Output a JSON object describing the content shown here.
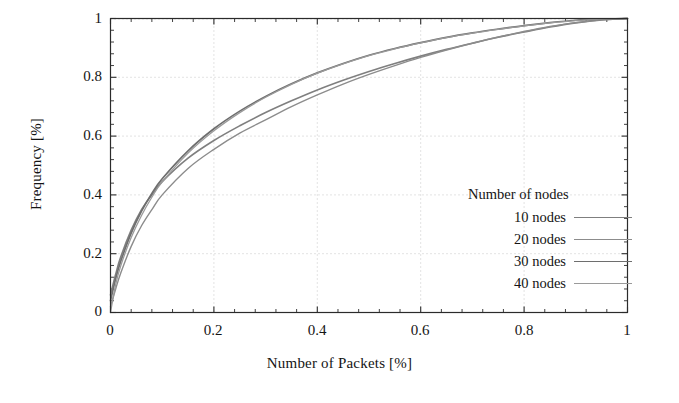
{
  "chart_data": {
    "type": "line",
    "title": "",
    "xlabel": "Number of Packets [%]",
    "ylabel": "Frequency [%]",
    "xlim": [
      0,
      1
    ],
    "ylim": [
      0,
      1
    ],
    "grid": true,
    "grid_style": "dotted",
    "legend_position": "inside-right",
    "legend_title": "Number of nodes",
    "xticks": [
      "0",
      "0.2",
      "0.4",
      "0.6",
      "0.8",
      "1"
    ],
    "xtick_values": [
      0,
      0.2,
      0.4,
      0.6,
      0.8,
      1
    ],
    "yticks": [
      "0",
      "0.2",
      "0.4",
      "0.6",
      "0.8",
      "1"
    ],
    "ytick_values": [
      0,
      0.2,
      0.4,
      0.6,
      0.8,
      1
    ],
    "minor_ticks_per_major": 5,
    "x": [
      0,
      0.01,
      0.02,
      0.04,
      0.06,
      0.08,
      0.1,
      0.15,
      0.2,
      0.25,
      0.3,
      0.35,
      0.4,
      0.45,
      0.5,
      0.55,
      0.6,
      0.65,
      0.7,
      0.75,
      0.8,
      0.85,
      0.9,
      0.95,
      1
    ],
    "series": [
      {
        "name": "10 nodes",
        "color": "#7f7f7f",
        "width": 1.6,
        "values": [
          0.06,
          0.13,
          0.19,
          0.28,
          0.35,
          0.4,
          0.445,
          0.525,
          0.585,
          0.635,
          0.68,
          0.72,
          0.757,
          0.79,
          0.82,
          0.847,
          0.872,
          0.895,
          0.916,
          0.936,
          0.954,
          0.971,
          0.985,
          0.995,
          1.0
        ]
      },
      {
        "name": "20 nodes",
        "color": "#8c8c8c",
        "width": 1.4,
        "values": [
          0.02,
          0.08,
          0.135,
          0.225,
          0.295,
          0.35,
          0.4,
          0.49,
          0.555,
          0.61,
          0.655,
          0.7,
          0.74,
          0.777,
          0.81,
          0.84,
          0.868,
          0.893,
          0.916,
          0.937,
          0.956,
          0.973,
          0.986,
          0.996,
          1.0
        ]
      },
      {
        "name": "30 nodes",
        "color": "#6e6e6e",
        "width": 1.7,
        "values": [
          0.04,
          0.115,
          0.175,
          0.27,
          0.345,
          0.405,
          0.455,
          0.55,
          0.625,
          0.685,
          0.735,
          0.778,
          0.815,
          0.847,
          0.875,
          0.898,
          0.918,
          0.936,
          0.951,
          0.964,
          0.976,
          0.986,
          0.994,
          0.998,
          1.0
        ]
      },
      {
        "name": "40 nodes",
        "color": "#9a9a9a",
        "width": 1.3,
        "values": [
          0.0,
          0.095,
          0.16,
          0.255,
          0.33,
          0.392,
          0.444,
          0.542,
          0.618,
          0.68,
          0.732,
          0.776,
          0.814,
          0.846,
          0.874,
          0.897,
          0.917,
          0.935,
          0.95,
          0.963,
          0.975,
          0.985,
          0.993,
          0.998,
          1.0
        ]
      }
    ]
  },
  "axes": {
    "xlabel": "Number of Packets [%]",
    "ylabel": "Frequency [%]"
  },
  "legend": {
    "title": "Number of nodes",
    "entries": [
      {
        "label": "10 nodes"
      },
      {
        "label": "20 nodes"
      },
      {
        "label": "30 nodes"
      },
      {
        "label": "40 nodes"
      }
    ]
  },
  "xticks": [
    {
      "label": "0"
    },
    {
      "label": "0.2"
    },
    {
      "label": "0.4"
    },
    {
      "label": "0.6"
    },
    {
      "label": "0.8"
    },
    {
      "label": "1"
    }
  ],
  "yticks": [
    {
      "label": "1"
    },
    {
      "label": "0.8"
    },
    {
      "label": "0.6"
    },
    {
      "label": "0.4"
    },
    {
      "label": "0.2"
    },
    {
      "label": "0"
    }
  ],
  "style": {
    "frame_color": "#2b2b2b",
    "grid_color": "#b9b9b9",
    "background": "#ffffff"
  }
}
